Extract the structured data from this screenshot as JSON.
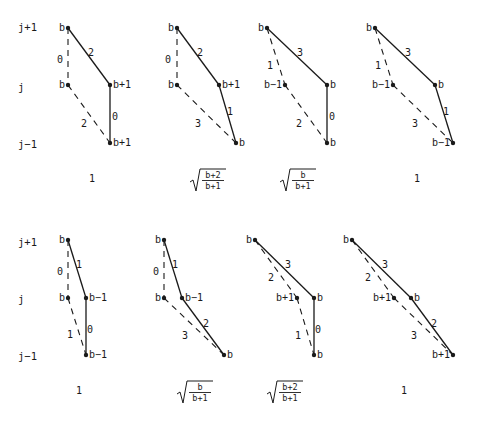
{
  "row_labels": [
    "j+1",
    "j",
    "j−1"
  ],
  "rows": [
    {
      "row_label_y": [
        28,
        88,
        145
      ],
      "panels": [
        {
          "nodes": {
            "top": {
              "x": 68,
              "y": 28,
              "label": "b",
              "label_side": "left"
            },
            "left": {
              "x": 68,
              "y": 85,
              "label": "b",
              "label_side": "left"
            },
            "right": {
              "x": 110,
              "y": 85,
              "label": "b+1",
              "label_side": "right"
            },
            "bottom": {
              "x": 110,
              "y": 143,
              "label": "b+1",
              "label_side": "right"
            }
          },
          "edges": [
            {
              "from": "top",
              "to": "left",
              "style": "dashed",
              "weight": "0",
              "lx": 60,
              "ly": 60
            },
            {
              "from": "top",
              "to": "right",
              "style": "solid",
              "weight": "2",
              "lx": 91,
              "ly": 53
            },
            {
              "from": "left",
              "to": "bottom",
              "style": "dashed",
              "weight": "2",
              "lx": 84,
              "ly": 124
            },
            {
              "from": "right",
              "to": "bottom",
              "style": "solid",
              "weight": "0",
              "lx": 115,
              "ly": 117
            }
          ],
          "coefficient": {
            "type": "plain",
            "text": "1",
            "x": 92,
            "y": 182
          }
        },
        {
          "nodes": {
            "top": {
              "x": 177,
              "y": 28,
              "label": "b",
              "label_side": "left"
            },
            "left": {
              "x": 177,
              "y": 85,
              "label": "b",
              "label_side": "left"
            },
            "right": {
              "x": 219,
              "y": 85,
              "label": "b+1",
              "label_side": "right"
            },
            "bottom": {
              "x": 236,
              "y": 143,
              "label": "b",
              "label_side": "right"
            }
          },
          "edges": [
            {
              "from": "top",
              "to": "left",
              "style": "dashed",
              "weight": "0",
              "lx": 168,
              "ly": 60
            },
            {
              "from": "top",
              "to": "right",
              "style": "solid",
              "weight": "2",
              "lx": 200,
              "ly": 53
            },
            {
              "from": "left",
              "to": "bottom",
              "style": "dashed",
              "weight": "3",
              "lx": 198,
              "ly": 124
            },
            {
              "from": "right",
              "to": "bottom",
              "style": "solid",
              "weight": "1",
              "lx": 230,
              "ly": 112
            }
          ],
          "coefficient": {
            "type": "sqrt",
            "num": "b+2",
            "den": "b+1",
            "x": 190,
            "y": 170
          }
        },
        {
          "nodes": {
            "top": {
              "x": 267,
              "y": 28,
              "label": "b",
              "label_side": "left"
            },
            "left": {
              "x": 285,
              "y": 85,
              "label": "b−1",
              "label_side": "left"
            },
            "right": {
              "x": 327,
              "y": 85,
              "label": "b",
              "label_side": "right"
            },
            "bottom": {
              "x": 327,
              "y": 143,
              "label": "b",
              "label_side": "right"
            }
          },
          "edges": [
            {
              "from": "top",
              "to": "left",
              "style": "dashed",
              "weight": "1",
              "lx": 270,
              "ly": 66
            },
            {
              "from": "top",
              "to": "right",
              "style": "solid",
              "weight": "3",
              "lx": 300,
              "ly": 53
            },
            {
              "from": "left",
              "to": "bottom",
              "style": "dashed",
              "weight": "2",
              "lx": 299,
              "ly": 124
            },
            {
              "from": "right",
              "to": "bottom",
              "style": "solid",
              "weight": "0",
              "lx": 332,
              "ly": 117
            }
          ],
          "coefficient": {
            "type": "sqrt",
            "num": "b",
            "den": "b+1",
            "x": 280,
            "y": 170
          }
        },
        {
          "nodes": {
            "top": {
              "x": 375,
              "y": 28,
              "label": "b",
              "label_side": "left"
            },
            "left": {
              "x": 393,
              "y": 85,
              "label": "b−1",
              "label_side": "left"
            },
            "right": {
              "x": 435,
              "y": 85,
              "label": "b",
              "label_side": "right"
            },
            "bottom": {
              "x": 453,
              "y": 143,
              "label": "b−1",
              "label_side": "left"
            }
          },
          "edges": [
            {
              "from": "top",
              "to": "left",
              "style": "dashed",
              "weight": "1",
              "lx": 378,
              "ly": 66
            },
            {
              "from": "top",
              "to": "right",
              "style": "solid",
              "weight": "3",
              "lx": 408,
              "ly": 53
            },
            {
              "from": "left",
              "to": "bottom",
              "style": "dashed",
              "weight": "3",
              "lx": 415,
              "ly": 124
            },
            {
              "from": "right",
              "to": "bottom",
              "style": "solid",
              "weight": "1",
              "lx": 446,
              "ly": 112
            }
          ],
          "coefficient": {
            "type": "plain",
            "text": "1",
            "x": 417,
            "y": 182
          }
        }
      ]
    },
    {
      "row_label_y": [
        243,
        300,
        357
      ],
      "panels": [
        {
          "nodes": {
            "top": {
              "x": 68,
              "y": 240,
              "label": "b",
              "label_side": "left"
            },
            "left": {
              "x": 68,
              "y": 298,
              "label": "b",
              "label_side": "left"
            },
            "right": {
              "x": 86,
              "y": 298,
              "label": "b−1",
              "label_side": "right"
            },
            "bottom": {
              "x": 86,
              "y": 355,
              "label": "b−1",
              "label_side": "right"
            }
          },
          "edges": [
            {
              "from": "top",
              "to": "left",
              "style": "dashed",
              "weight": "0",
              "lx": 60,
              "ly": 272
            },
            {
              "from": "top",
              "to": "right",
              "style": "solid",
              "weight": "1",
              "lx": 79,
              "ly": 265
            },
            {
              "from": "left",
              "to": "bottom",
              "style": "dashed",
              "weight": "1",
              "lx": 70,
              "ly": 335
            },
            {
              "from": "right",
              "to": "bottom",
              "style": "solid",
              "weight": "0",
              "lx": 90,
              "ly": 330
            }
          ],
          "coefficient": {
            "type": "plain",
            "text": "1",
            "x": 79,
            "y": 394
          }
        },
        {
          "nodes": {
            "top": {
              "x": 164,
              "y": 240,
              "label": "b",
              "label_side": "left"
            },
            "left": {
              "x": 164,
              "y": 298,
              "label": "b",
              "label_side": "left"
            },
            "right": {
              "x": 182,
              "y": 298,
              "label": "b−1",
              "label_side": "right"
            },
            "bottom": {
              "x": 224,
              "y": 355,
              "label": "b",
              "label_side": "right"
            }
          },
          "edges": [
            {
              "from": "top",
              "to": "left",
              "style": "dashed",
              "weight": "0",
              "lx": 156,
              "ly": 272
            },
            {
              "from": "top",
              "to": "right",
              "style": "solid",
              "weight": "1",
              "lx": 175,
              "ly": 265
            },
            {
              "from": "left",
              "to": "bottom",
              "style": "dashed",
              "weight": "3",
              "lx": 185,
              "ly": 336
            },
            {
              "from": "right",
              "to": "bottom",
              "style": "solid",
              "weight": "2",
              "lx": 206,
              "ly": 324
            }
          ],
          "coefficient": {
            "type": "sqrt",
            "num": "b",
            "den": "b+1",
            "x": 177,
            "y": 382
          }
        },
        {
          "nodes": {
            "top": {
              "x": 255,
              "y": 240,
              "label": "b",
              "label_side": "left"
            },
            "left": {
              "x": 297,
              "y": 298,
              "label": "b+1",
              "label_side": "left"
            },
            "right": {
              "x": 314,
              "y": 298,
              "label": "b",
              "label_side": "right"
            },
            "bottom": {
              "x": 314,
              "y": 355,
              "label": "b",
              "label_side": "right"
            }
          },
          "edges": [
            {
              "from": "top",
              "to": "left",
              "style": "dashed",
              "weight": "2",
              "lx": 271,
              "ly": 278
            },
            {
              "from": "top",
              "to": "right",
              "style": "solid",
              "weight": "3",
              "lx": 288,
              "ly": 265
            },
            {
              "from": "left",
              "to": "bottom",
              "style": "dashed",
              "weight": "1",
              "lx": 298,
              "ly": 336
            },
            {
              "from": "right",
              "to": "bottom",
              "style": "solid",
              "weight": "0",
              "lx": 318,
              "ly": 330
            }
          ],
          "coefficient": {
            "type": "sqrt",
            "num": "b+2",
            "den": "b+1",
            "x": 267,
            "y": 382
          }
        },
        {
          "nodes": {
            "top": {
              "x": 352,
              "y": 240,
              "label": "b",
              "label_side": "left"
            },
            "left": {
              "x": 394,
              "y": 298,
              "label": "b+1",
              "label_side": "left"
            },
            "right": {
              "x": 411,
              "y": 298,
              "label": "b",
              "label_side": "right"
            },
            "bottom": {
              "x": 453,
              "y": 355,
              "label": "b+1",
              "label_side": "left"
            }
          },
          "edges": [
            {
              "from": "top",
              "to": "left",
              "style": "dashed",
              "weight": "2",
              "lx": 368,
              "ly": 278
            },
            {
              "from": "top",
              "to": "right",
              "style": "solid",
              "weight": "3",
              "lx": 385,
              "ly": 265
            },
            {
              "from": "left",
              "to": "bottom",
              "style": "dashed",
              "weight": "3",
              "lx": 414,
              "ly": 336
            },
            {
              "from": "right",
              "to": "bottom",
              "style": "solid",
              "weight": "2",
              "lx": 434,
              "ly": 324
            }
          ],
          "coefficient": {
            "type": "plain",
            "text": "1",
            "x": 404,
            "y": 394
          }
        }
      ]
    }
  ],
  "colors": {
    "ink": "#1a1a1a",
    "background": "#ffffff"
  }
}
